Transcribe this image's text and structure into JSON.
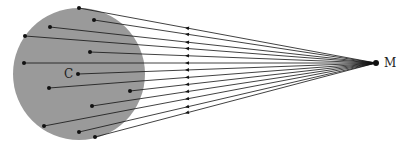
{
  "diagram": {
    "colors": {
      "body_fill": "#9a9a9a",
      "line": "#111111",
      "background": "#ffffff"
    },
    "body": {
      "cx": 79,
      "cy": 74,
      "r": 66
    },
    "center_label": "C",
    "center_point": {
      "x": 78,
      "y": 74
    },
    "external_label": "M",
    "external_point": {
      "x": 376,
      "y": 63
    },
    "mass_elements": [
      {
        "x": 79,
        "y": 8
      },
      {
        "x": 94,
        "y": 20
      },
      {
        "x": 50,
        "y": 27
      },
      {
        "x": 25,
        "y": 36
      },
      {
        "x": 90,
        "y": 52
      },
      {
        "x": 24,
        "y": 63
      },
      {
        "x": 78,
        "y": 74
      },
      {
        "x": 49,
        "y": 88
      },
      {
        "x": 130,
        "y": 91
      },
      {
        "x": 92,
        "y": 106
      },
      {
        "x": 44,
        "y": 126
      },
      {
        "x": 79,
        "y": 132
      },
      {
        "x": 95,
        "y": 137
      }
    ],
    "arrow_x": 185,
    "arrow_direction": "toward body"
  }
}
